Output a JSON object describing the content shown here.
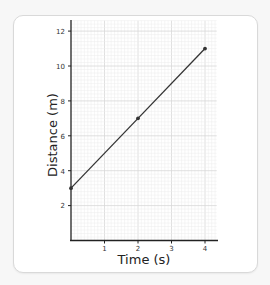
{
  "chart_data": {
    "type": "line",
    "title": "",
    "xlabel": "Time (s)",
    "ylabel": "Distance (m)",
    "x": [
      0,
      2,
      4
    ],
    "series": [
      {
        "name": "Distance",
        "values": [
          3,
          7,
          11
        ]
      }
    ],
    "xticks": [
      1,
      2,
      3,
      4
    ],
    "yticks": [
      2,
      4,
      6,
      8,
      10,
      12
    ],
    "xlim": [
      0,
      4.35
    ],
    "ylim": [
      0,
      12.6
    ],
    "grid": true,
    "minor_grid_per_unit_x": 10,
    "minor_grid_per_unit_y": 5,
    "markers": true,
    "legend": null
  },
  "labels": {
    "x_axis_title": "Time (s)",
    "y_axis_title": "Distance (m)",
    "xtick_1": "1",
    "xtick_2": "2",
    "xtick_3": "3",
    "xtick_4": "4",
    "ytick_2": "2",
    "ytick_4": "4",
    "ytick_6": "6",
    "ytick_8": "8",
    "ytick_10": "10",
    "ytick_12": "12"
  },
  "colors": {
    "line": "#333333",
    "grid_minor": "#ececec",
    "grid_major": "#d8d8d8",
    "axis": "#222222"
  }
}
